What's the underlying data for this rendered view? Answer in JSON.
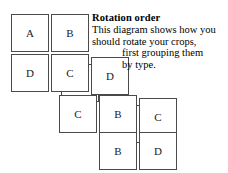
{
  "document": {
    "title": "Rotation order",
    "body_lines": [
      {
        "text": "This diagram shows how you",
        "indent": false
      },
      {
        "text": "should rotate your crops,",
        "indent": false
      },
      {
        "text": "first grouping them",
        "indent": true
      },
      {
        "text": "by type.",
        "indent": true
      }
    ]
  },
  "diagram": {
    "type": "crop-rotation-grid",
    "box_size": 38,
    "groups": [
      {
        "name": "group-1",
        "origin": {
          "x": 11,
          "y": 14
        },
        "has_stack_shadow": true,
        "stack_offset": {
          "x": 10,
          "y": 10
        },
        "cells": [
          {
            "label": "A",
            "col": 0,
            "row": 0
          },
          {
            "label": "B",
            "col": 1,
            "row": 0
          },
          {
            "label": "D",
            "col": 0,
            "row": 1
          },
          {
            "label": "C",
            "col": 1,
            "row": 1
          }
        ]
      },
      {
        "name": "group-2",
        "origin": {
          "x": 51,
          "y": 92
        },
        "has_stack_shadow": true,
        "stack_offset": {
          "x": 10,
          "y": 10
        },
        "cells": [
          {
            "label": "C",
            "col": 0,
            "row": 0
          },
          {
            "label": "B",
            "col": 1,
            "row": 0
          },
          {
            "label": "B",
            "col": 1,
            "row": 1
          }
        ]
      },
      {
        "name": "group-3",
        "origin": {
          "x": 91,
          "y": 57
        },
        "has_stack_shadow": false,
        "cells": [
          {
            "label": "D",
            "col": 0,
            "row": 0
          },
          {
            "label": "C",
            "col": 1,
            "row": 1
          },
          {
            "label": "D",
            "col": 1,
            "row": 2
          }
        ]
      }
    ],
    "boxes": [
      {
        "id": "box-a-1",
        "label": "A",
        "x": 11,
        "y": 14,
        "z": 3
      },
      {
        "id": "box-b-1",
        "label": "B",
        "x": 51,
        "y": 14,
        "z": 3
      },
      {
        "id": "box-d-1",
        "label": "D",
        "x": 11,
        "y": 54,
        "z": 3
      },
      {
        "id": "box-c-1",
        "label": "C",
        "x": 51,
        "y": 54,
        "z": 3
      },
      {
        "id": "box-d-2",
        "label": "D",
        "x": 91,
        "y": 57,
        "z": 3
      },
      {
        "id": "box-c-2",
        "label": "C",
        "x": 59,
        "y": 95,
        "z": 3
      },
      {
        "id": "box-b-2",
        "label": "B",
        "x": 99,
        "y": 95,
        "z": 3
      },
      {
        "id": "box-c-3",
        "label": "C",
        "x": 139,
        "y": 98,
        "z": 3
      },
      {
        "id": "box-b-3",
        "label": "B",
        "x": 99,
        "y": 132,
        "z": 3
      },
      {
        "id": "box-d-3",
        "label": "D",
        "x": 139,
        "y": 132,
        "z": 3
      }
    ],
    "shadows": [
      {
        "id": "shadow-1",
        "x": 61,
        "y": 64,
        "z": 1
      },
      {
        "id": "shadow-2",
        "x": 109,
        "y": 105,
        "z": 1
      }
    ],
    "stack_bars": [
      {
        "id": "stack-bar-1",
        "x": 61,
        "y": 82,
        "w": 26
      },
      {
        "id": "stack-bar-2",
        "x": 109,
        "y": 123,
        "w": 26
      }
    ]
  },
  "colors": {
    "box_border": "#4a4a4a",
    "box_fill": "#ffffff",
    "text": "#000000",
    "page_background": "#ffffff",
    "stack_bar": "#3a3a3a"
  }
}
